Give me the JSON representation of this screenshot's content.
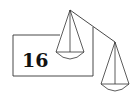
{
  "diagram": {
    "type": "balance-scale",
    "box_label": "16",
    "colors": {
      "stroke": "#333333",
      "text": "#111111",
      "background": "#ffffff"
    },
    "left_pan": {
      "apex": [
        70,
        10
      ],
      "state": "raised"
    },
    "right_pan": {
      "apex": [
        115,
        42
      ],
      "state": "lowered"
    }
  }
}
